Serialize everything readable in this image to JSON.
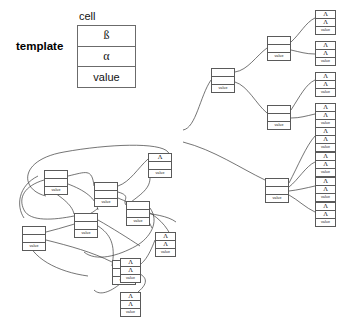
{
  "figure": {
    "type": "diagram"
  },
  "legend": {
    "template_label": "template",
    "cell_label": "cell",
    "rows": [
      {
        "name": "beta-row",
        "text": "ß"
      },
      {
        "name": "alpha-row",
        "text": "α"
      },
      {
        "name": "value-row",
        "text": "value"
      }
    ]
  },
  "glyphs": {
    "lambda": "Λ",
    "value": "value",
    "empty": ""
  },
  "colors": {
    "background": "#ffffff",
    "node_border": "#5a5a5a",
    "legend_border": "#6b6b6b",
    "wire": "#3a3a3a",
    "text": "#111111"
  },
  "right_tree": {
    "name": "right-binary-tree",
    "root": {
      "id": "r-root",
      "x": 211,
      "y": 68,
      "kind": "value",
      "rows": [
        "",
        "",
        "value"
      ]
    },
    "internal": [
      {
        "id": "r-a",
        "x": 267,
        "y": 36,
        "kind": "value",
        "rows": [
          "",
          "",
          "value"
        ]
      },
      {
        "id": "r-b",
        "x": 267,
        "y": 105,
        "kind": "value",
        "rows": [
          "",
          "",
          "value"
        ]
      },
      {
        "id": "r-c",
        "x": 265,
        "y": 178,
        "kind": "value",
        "rows": [
          "",
          "",
          "value"
        ]
      }
    ],
    "leaves": [
      {
        "id": "r-l1",
        "x": 315,
        "y": 10,
        "rows": [
          "Λ",
          "Λ",
          "value"
        ]
      },
      {
        "id": "r-l2",
        "x": 315,
        "y": 41,
        "rows": [
          "Λ",
          "Λ",
          "value"
        ]
      },
      {
        "id": "r-l3",
        "x": 315,
        "y": 72,
        "rows": [
          "Λ",
          "Λ",
          "value"
        ]
      },
      {
        "id": "r-l4",
        "x": 315,
        "y": 103,
        "rows": [
          "Λ",
          "Λ",
          "value"
        ]
      },
      {
        "id": "r-l5",
        "x": 315,
        "y": 127,
        "rows": [
          "Λ",
          "Λ",
          "value"
        ]
      },
      {
        "id": "r-l6",
        "x": 315,
        "y": 152,
        "rows": [
          "Λ",
          "Λ",
          "value"
        ]
      },
      {
        "id": "r-l7",
        "x": 315,
        "y": 177,
        "rows": [
          "Λ",
          "Λ",
          "value"
        ]
      },
      {
        "id": "r-l8",
        "x": 315,
        "y": 202,
        "rows": [
          "Λ",
          "Λ",
          "value"
        ]
      }
    ]
  },
  "left_cluster": {
    "name": "left-tangled-cluster",
    "nodes": [
      {
        "id": "c-1",
        "x": 44,
        "y": 170,
        "kind": "value",
        "rows": [
          "",
          "",
          "value"
        ]
      },
      {
        "id": "c-2",
        "x": 94,
        "y": 182,
        "kind": "value",
        "rows": [
          "",
          "",
          "value"
        ]
      },
      {
        "id": "c-3",
        "x": 148,
        "y": 153,
        "kind": "lambda1",
        "rows": [
          "Λ",
          "",
          "value"
        ]
      },
      {
        "id": "c-4",
        "x": 126,
        "y": 201,
        "kind": "value",
        "rows": [
          "",
          "",
          "value"
        ]
      },
      {
        "id": "c-5",
        "x": 22,
        "y": 226,
        "kind": "value",
        "rows": [
          "",
          "",
          "value"
        ]
      },
      {
        "id": "c-6",
        "x": 74,
        "y": 213,
        "kind": "value",
        "rows": [
          "",
          "",
          "value"
        ]
      },
      {
        "id": "c-7",
        "x": 112,
        "y": 260,
        "kind": "value",
        "rows": [
          "",
          "",
          "value"
        ]
      }
    ],
    "leaves": [
      {
        "id": "c-l1",
        "x": 155,
        "y": 232,
        "rows": [
          "Λ",
          "Λ",
          "value"
        ]
      },
      {
        "id": "c-l2",
        "x": 120,
        "y": 258,
        "rows": [
          "Λ",
          "Λ",
          "value"
        ]
      },
      {
        "id": "c-l3",
        "x": 120,
        "y": 292,
        "rows": [
          "Λ",
          "Λ",
          "value"
        ]
      }
    ]
  }
}
